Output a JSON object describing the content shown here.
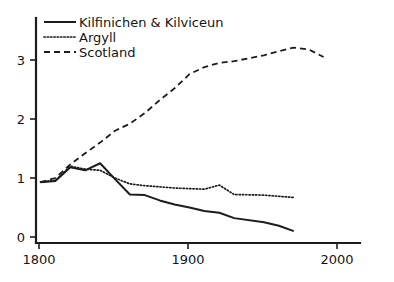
{
  "chart_data": {
    "type": "line",
    "title": "",
    "subtitle": "",
    "xlabel": "",
    "ylabel": "",
    "xlim": [
      1795,
      2012
    ],
    "ylim": [
      0,
      3.62
    ],
    "grid": false,
    "legend_position": "top-left",
    "x_ticks": [
      1800,
      1900,
      2000
    ],
    "x_tick_labels": [
      "1800",
      "1900",
      "2000"
    ],
    "y_ticks": [
      0,
      1,
      2,
      3
    ],
    "y_tick_labels": [
      "0",
      "1",
      "2",
      "3"
    ],
    "series": [
      {
        "name": "Kilfinichen & Kilviceun",
        "style": "solid",
        "color": "#1c1c1c",
        "x": [
          1801,
          1811,
          1821,
          1831,
          1841,
          1851,
          1861,
          1871,
          1881,
          1891,
          1901,
          1911,
          1921,
          1931,
          1951,
          1961,
          1971
        ],
        "values": [
          0.93,
          0.95,
          1.18,
          1.13,
          1.25,
          0.98,
          0.72,
          0.71,
          0.62,
          0.55,
          0.5,
          0.44,
          0.41,
          0.32,
          0.25,
          0.19,
          0.1
        ]
      },
      {
        "name": "Argyll",
        "style": "dotted",
        "color": "#1c1c1c",
        "x": [
          1801,
          1811,
          1821,
          1831,
          1841,
          1851,
          1861,
          1871,
          1881,
          1891,
          1901,
          1911,
          1921,
          1931,
          1951,
          1961,
          1971
        ],
        "values": [
          0.93,
          0.96,
          1.2,
          1.15,
          1.13,
          1.0,
          0.9,
          0.87,
          0.85,
          0.83,
          0.82,
          0.81,
          0.88,
          0.72,
          0.71,
          0.69,
          0.67
        ]
      },
      {
        "name": "Scotland",
        "style": "dashed",
        "color": "#1c1c1c",
        "x": [
          1801,
          1811,
          1821,
          1831,
          1841,
          1851,
          1861,
          1871,
          1881,
          1891,
          1901,
          1911,
          1921,
          1931,
          1951,
          1961,
          1971,
          1981,
          1991
        ],
        "values": [
          0.93,
          1.0,
          1.23,
          1.42,
          1.6,
          1.8,
          1.92,
          2.1,
          2.32,
          2.52,
          2.76,
          2.88,
          2.95,
          2.98,
          3.08,
          3.15,
          3.21,
          3.18,
          3.05
        ]
      }
    ],
    "legend": [
      {
        "label": "Kilfinichen & Kilviceun",
        "style": "solid"
      },
      {
        "label": "Argyll",
        "style": "dotted"
      },
      {
        "label": "Scotland",
        "style": "dashed"
      }
    ]
  }
}
